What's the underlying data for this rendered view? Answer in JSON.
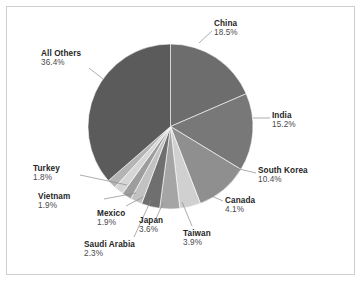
{
  "figure": {
    "background_color": "#ffffff",
    "frame_color": "#cfcfcf"
  },
  "chart_data": {
    "type": "pie",
    "title": "",
    "subtitle": "",
    "xlabel": "",
    "ylabel": "",
    "legend_position": "none",
    "labels_position": "outside-callout",
    "grid": false,
    "start_angle_deg": 90,
    "direction": "clockwise",
    "units": "percent",
    "categories": [
      "China",
      "India",
      "South Korea",
      "Canada",
      "Taiwan",
      "Japan",
      "Saudi Arabia",
      "Mexico",
      "Vietnam",
      "Turkey",
      "All Others"
    ],
    "values": [
      18.5,
      15.2,
      10.4,
      4.1,
      3.9,
      3.6,
      2.3,
      1.9,
      1.9,
      1.8,
      36.4
    ],
    "value_labels": [
      "18.5%",
      "15.2%",
      "10.4%",
      "4.1%",
      "3.9%",
      "3.6%",
      "2.3%",
      "1.9%",
      "1.9%",
      "1.8%",
      "36.4%"
    ],
    "slice_colors": [
      "#6d6d6d",
      "#787878",
      "#8f8f8f",
      "#d0d0d0",
      "#a5a5a5",
      "#6f6f6f",
      "#c2c2c2",
      "#9d9d9d",
      "#d6d6d6",
      "#b4b4b4",
      "#5b5b5b"
    ],
    "slices": [
      {
        "label": "China",
        "value": 18.5,
        "value_label": "18.5%",
        "color": "#6d6d6d"
      },
      {
        "label": "India",
        "value": 15.2,
        "value_label": "15.2%",
        "color": "#787878"
      },
      {
        "label": "South Korea",
        "value": 10.4,
        "value_label": "10.4%",
        "color": "#8f8f8f"
      },
      {
        "label": "Canada",
        "value": 4.1,
        "value_label": "4.1%",
        "color": "#d0d0d0"
      },
      {
        "label": "Taiwan",
        "value": 3.9,
        "value_label": "3.9%",
        "color": "#a5a5a5"
      },
      {
        "label": "Japan",
        "value": 3.6,
        "value_label": "3.6%",
        "color": "#6f6f6f"
      },
      {
        "label": "Saudi Arabia",
        "value": 2.3,
        "value_label": "2.3%",
        "color": "#c2c2c2"
      },
      {
        "label": "Mexico",
        "value": 1.9,
        "value_label": "1.9%",
        "color": "#9d9d9d"
      },
      {
        "label": "Vietnam",
        "value": 1.9,
        "value_label": "1.9%",
        "color": "#d6d6d6"
      },
      {
        "label": "Turkey",
        "value": 1.8,
        "value_label": "1.8%",
        "color": "#b4b4b4"
      },
      {
        "label": "All Others",
        "value": 36.4,
        "value_label": "36.4%",
        "color": "#5b5b5b"
      }
    ]
  }
}
